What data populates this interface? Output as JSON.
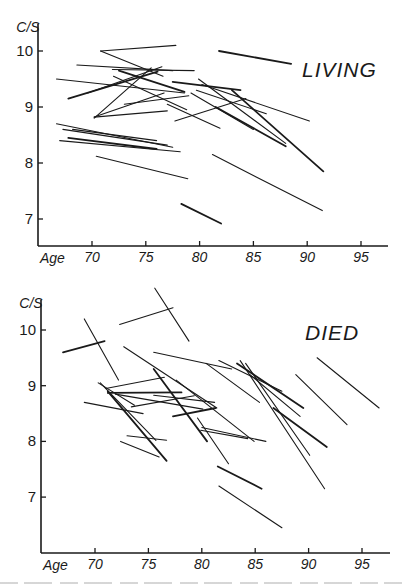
{
  "chart_data": [
    {
      "type": "line",
      "title": "LIVING",
      "xlabel": "Age",
      "ylabel": "C/S",
      "x_ticks": [
        70,
        75,
        80,
        85,
        90,
        95
      ],
      "y_ticks": [
        7,
        8,
        9,
        10
      ],
      "xlim": [
        65.5,
        97.5
      ],
      "ylim": [
        6.5,
        10.5
      ],
      "grid": false,
      "legend": null,
      "description": "Longitudinal segments: each line connects a subject's C/S value at two ages",
      "segments": [
        {
          "x": [
            70.8,
            77.8
          ],
          "y": [
            10.0,
            10.1
          ]
        },
        {
          "x": [
            70.8,
            76.6
          ],
          "y": [
            10.0,
            9.55
          ]
        },
        {
          "x": [
            81.8,
            88.5
          ],
          "y": [
            10.0,
            9.77
          ]
        },
        {
          "x": [
            68.6,
            77.5
          ],
          "y": [
            9.75,
            9.65
          ]
        },
        {
          "x": [
            71.9,
            79.5
          ],
          "y": [
            9.67,
            9.65
          ]
        },
        {
          "x": [
            66.7,
            78.6
          ],
          "y": [
            9.5,
            9.25
          ]
        },
        {
          "x": [
            67.8,
            76.1
          ],
          "y": [
            9.15,
            9.63
          ]
        },
        {
          "x": [
            69.6,
            76.5
          ],
          "y": [
            9.25,
            9.72
          ]
        },
        {
          "x": [
            70.2,
            75.5
          ],
          "y": [
            8.8,
            9.7
          ]
        },
        {
          "x": [
            72.0,
            78.8
          ],
          "y": [
            9.55,
            8.95
          ]
        },
        {
          "x": [
            72.5,
            78.6
          ],
          "y": [
            9.65,
            9.27
          ]
        },
        {
          "x": [
            70.2,
            76.7
          ],
          "y": [
            8.82,
            9.25
          ]
        },
        {
          "x": [
            70.2,
            77.0
          ],
          "y": [
            8.82,
            8.93
          ]
        },
        {
          "x": [
            73.0,
            79.0
          ],
          "y": [
            9.05,
            9.2
          ]
        },
        {
          "x": [
            77.5,
            83.8
          ],
          "y": [
            9.45,
            9.3
          ]
        },
        {
          "x": [
            79.7,
            86.2
          ],
          "y": [
            9.3,
            8.88
          ]
        },
        {
          "x": [
            80.2,
            90.2
          ],
          "y": [
            9.4,
            8.75
          ]
        },
        {
          "x": [
            79.9,
            88.0
          ],
          "y": [
            9.5,
            8.35
          ]
        },
        {
          "x": [
            81.5,
            88.0
          ],
          "y": [
            9.0,
            8.3
          ]
        },
        {
          "x": [
            79.2,
            85.0
          ],
          "y": [
            9.25,
            8.6
          ]
        },
        {
          "x": [
            77.7,
            84.3
          ],
          "y": [
            8.75,
            9.15
          ]
        },
        {
          "x": [
            77.0,
            81.9
          ],
          "y": [
            9.05,
            8.62
          ]
        },
        {
          "x": [
            83.0,
            91.5
          ],
          "y": [
            9.3,
            7.85
          ]
        },
        {
          "x": [
            66.7,
            77.5
          ],
          "y": [
            8.7,
            8.28
          ]
        },
        {
          "x": [
            67.3,
            77.0
          ],
          "y": [
            8.6,
            8.32
          ]
        },
        {
          "x": [
            68.2,
            76.0
          ],
          "y": [
            8.6,
            8.4
          ]
        },
        {
          "x": [
            67.8,
            76.0
          ],
          "y": [
            8.45,
            8.25
          ]
        },
        {
          "x": [
            67.0,
            78.2
          ],
          "y": [
            8.4,
            8.2
          ]
        },
        {
          "x": [
            70.4,
            78.9
          ],
          "y": [
            8.12,
            7.72
          ]
        },
        {
          "x": [
            81.2,
            91.4
          ],
          "y": [
            8.15,
            7.15
          ]
        },
        {
          "x": [
            78.3,
            82.0
          ],
          "y": [
            7.27,
            6.92
          ]
        }
      ]
    },
    {
      "type": "line",
      "title": "DIED",
      "xlabel": "Age",
      "ylabel": "C/S",
      "x_ticks": [
        70,
        75,
        80,
        85,
        90,
        95
      ],
      "y_ticks": [
        7,
        8,
        9,
        10
      ],
      "xlim": [
        65.5,
        97.5
      ],
      "ylim": [
        6.0,
        10.9
      ],
      "grid": false,
      "legend": null,
      "description": "Longitudinal segments: each line connects a subject's C/S value at two ages",
      "segments": [
        {
          "x": [
            75.6,
            78.8
          ],
          "y": [
            10.75,
            9.8
          ]
        },
        {
          "x": [
            72.3,
            77.3
          ],
          "y": [
            10.1,
            10.4
          ]
        },
        {
          "x": [
            67.0,
            70.9
          ],
          "y": [
            9.6,
            9.8
          ]
        },
        {
          "x": [
            69.0,
            72.2
          ],
          "y": [
            10.2,
            9.1
          ]
        },
        {
          "x": [
            72.7,
            81.4
          ],
          "y": [
            9.7,
            8.6
          ]
        },
        {
          "x": [
            75.5,
            82.8
          ],
          "y": [
            9.6,
            9.3
          ]
        },
        {
          "x": [
            75.5,
            80.5
          ],
          "y": [
            9.3,
            8.0
          ]
        },
        {
          "x": [
            77.6,
            84.9
          ],
          "y": [
            9.1,
            8.0
          ]
        },
        {
          "x": [
            80.4,
            85.4
          ],
          "y": [
            9.4,
            8.7
          ]
        },
        {
          "x": [
            81.6,
            87.5
          ],
          "y": [
            9.45,
            8.9
          ]
        },
        {
          "x": [
            83.3,
            89.5
          ],
          "y": [
            9.4,
            8.6
          ]
        },
        {
          "x": [
            84.5,
            89.2
          ],
          "y": [
            9.2,
            8.45
          ]
        },
        {
          "x": [
            84.1,
            90.1
          ],
          "y": [
            9.4,
            7.75
          ]
        },
        {
          "x": [
            83.6,
            91.5
          ],
          "y": [
            9.45,
            7.15
          ]
        },
        {
          "x": [
            86.7,
            91.7
          ],
          "y": [
            8.6,
            7.9
          ]
        },
        {
          "x": [
            88.8,
            93.6
          ],
          "y": [
            9.2,
            8.3
          ]
        },
        {
          "x": [
            90.8,
            96.6
          ],
          "y": [
            9.5,
            8.6
          ]
        },
        {
          "x": [
            71.0,
            76.5
          ],
          "y": [
            8.95,
            9.15
          ]
        },
        {
          "x": [
            71.2,
            78.1
          ],
          "y": [
            8.87,
            8.88
          ]
        },
        {
          "x": [
            71.9,
            80.1
          ],
          "y": [
            8.85,
            8.58
          ]
        },
        {
          "x": [
            70.3,
            73.7
          ],
          "y": [
            9.05,
            8.65
          ]
        },
        {
          "x": [
            70.5,
            75.7
          ],
          "y": [
            9.05,
            8.02
          ]
        },
        {
          "x": [
            71.2,
            76.7
          ],
          "y": [
            8.9,
            7.65
          ]
        },
        {
          "x": [
            69.0,
            74.5
          ],
          "y": [
            8.7,
            8.5
          ]
        },
        {
          "x": [
            73.4,
            79.3
          ],
          "y": [
            8.62,
            8.82
          ]
        },
        {
          "x": [
            75.5,
            81.2
          ],
          "y": [
            8.83,
            8.7
          ]
        },
        {
          "x": [
            77.3,
            81.3
          ],
          "y": [
            8.45,
            8.6
          ]
        },
        {
          "x": [
            79.6,
            82.5
          ],
          "y": [
            8.42,
            7.6
          ]
        },
        {
          "x": [
            79.9,
            84.3
          ],
          "y": [
            8.2,
            8.05
          ]
        },
        {
          "x": [
            80.0,
            86.0
          ],
          "y": [
            8.25,
            8.0
          ]
        },
        {
          "x": [
            81.5,
            85.6
          ],
          "y": [
            7.55,
            7.15
          ]
        },
        {
          "x": [
            81.6,
            87.5
          ],
          "y": [
            7.2,
            6.45
          ]
        },
        {
          "x": [
            72.4,
            76.0
          ],
          "y": [
            8.0,
            7.72
          ]
        },
        {
          "x": [
            73.0,
            76.7
          ],
          "y": [
            8.1,
            8.02
          ]
        }
      ]
    }
  ],
  "panels": {
    "top": {
      "title": "LIVING",
      "ylabel": "C/S",
      "xlabel": "Age"
    },
    "bottom": {
      "title": "DIED",
      "ylabel": "C/S",
      "xlabel": "Age"
    }
  }
}
